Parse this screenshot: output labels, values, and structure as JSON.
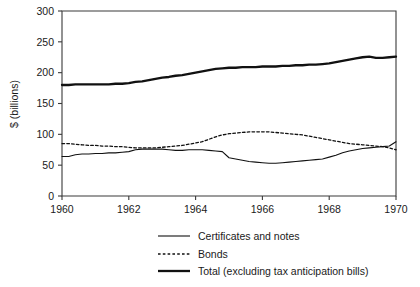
{
  "chart_data": {
    "type": "line",
    "title": "",
    "xlabel": "",
    "ylabel": "$ (billions)",
    "xlim": [
      1960,
      1970
    ],
    "ylim": [
      0,
      300
    ],
    "xticks": [
      1960,
      1962,
      1964,
      1966,
      1968,
      1970
    ],
    "xtick_labels": [
      "1960",
      "1962",
      "1964",
      "1966",
      "1968",
      "1970"
    ],
    "yticks": [
      0,
      50,
      100,
      150,
      200,
      250,
      300
    ],
    "ytick_labels": [
      "0",
      "50",
      "100",
      "150",
      "200",
      "250",
      "300"
    ],
    "grid": false,
    "legend_position": "below",
    "series": [
      {
        "name": "Certificates and notes",
        "style": "solid-thin",
        "color": "#111111",
        "x": [
          1960.0,
          1960.2,
          1960.4,
          1960.6,
          1960.8,
          1961.0,
          1961.2,
          1961.4,
          1961.6,
          1961.8,
          1962.0,
          1962.2,
          1962.4,
          1962.6,
          1962.8,
          1963.0,
          1963.2,
          1963.4,
          1963.6,
          1963.8,
          1964.0,
          1964.2,
          1964.4,
          1964.6,
          1964.8,
          1965.0,
          1965.2,
          1965.4,
          1965.6,
          1965.8,
          1966.0,
          1966.2,
          1966.4,
          1966.6,
          1966.8,
          1967.0,
          1967.2,
          1967.4,
          1967.6,
          1967.8,
          1968.0,
          1968.2,
          1968.4,
          1968.6,
          1968.8,
          1969.0,
          1969.2,
          1969.4,
          1969.6,
          1969.8,
          1970.0
        ],
        "values": [
          64,
          64,
          67,
          68,
          68,
          69,
          69,
          70,
          70,
          71,
          72,
          75,
          76,
          76,
          76,
          76,
          75,
          74,
          74,
          75,
          75,
          75,
          74,
          73,
          72,
          62,
          60,
          58,
          56,
          55,
          54,
          53,
          53,
          54,
          55,
          56,
          57,
          58,
          59,
          60,
          63,
          66,
          70,
          73,
          75,
          77,
          78,
          79,
          80,
          81,
          88
        ]
      },
      {
        "name": "Bonds",
        "style": "dashed",
        "color": "#111111",
        "x": [
          1960.0,
          1960.2,
          1960.4,
          1960.6,
          1960.8,
          1961.0,
          1961.2,
          1961.4,
          1961.6,
          1961.8,
          1962.0,
          1962.2,
          1962.4,
          1962.6,
          1962.8,
          1963.0,
          1963.2,
          1963.4,
          1963.6,
          1963.8,
          1964.0,
          1964.2,
          1964.4,
          1964.6,
          1964.8,
          1965.0,
          1965.2,
          1965.4,
          1965.6,
          1965.8,
          1966.0,
          1966.2,
          1966.4,
          1966.6,
          1966.8,
          1967.0,
          1967.2,
          1967.4,
          1967.6,
          1967.8,
          1968.0,
          1968.2,
          1968.4,
          1968.6,
          1968.8,
          1969.0,
          1969.2,
          1969.4,
          1969.6,
          1969.8,
          1970.0
        ],
        "values": [
          85,
          85,
          84,
          83,
          82,
          82,
          81,
          81,
          80,
          80,
          79,
          78,
          78,
          78,
          78,
          79,
          80,
          81,
          82,
          84,
          86,
          88,
          92,
          96,
          99,
          101,
          102,
          103,
          104,
          104,
          104,
          104,
          103,
          102,
          101,
          100,
          99,
          97,
          95,
          93,
          91,
          89,
          87,
          85,
          84,
          83,
          82,
          81,
          80,
          78,
          75
        ]
      },
      {
        "name": "Total (excluding tax anticipation bills)",
        "style": "solid-thick",
        "color": "#111111",
        "x": [
          1960.0,
          1960.2,
          1960.4,
          1960.6,
          1960.8,
          1961.0,
          1961.2,
          1961.4,
          1961.6,
          1961.8,
          1962.0,
          1962.2,
          1962.4,
          1962.6,
          1962.8,
          1963.0,
          1963.2,
          1963.4,
          1963.6,
          1963.8,
          1964.0,
          1964.2,
          1964.4,
          1964.6,
          1964.8,
          1965.0,
          1965.2,
          1965.4,
          1965.6,
          1965.8,
          1966.0,
          1966.2,
          1966.4,
          1966.6,
          1966.8,
          1967.0,
          1967.2,
          1967.4,
          1967.6,
          1967.8,
          1968.0,
          1968.2,
          1968.4,
          1968.6,
          1968.8,
          1969.0,
          1969.2,
          1969.4,
          1969.6,
          1969.8,
          1970.0
        ],
        "values": [
          180,
          180,
          181,
          181,
          181,
          181,
          181,
          181,
          182,
          182,
          183,
          185,
          186,
          188,
          190,
          192,
          193,
          195,
          196,
          198,
          200,
          202,
          204,
          206,
          207,
          208,
          208,
          209,
          209,
          209,
          210,
          210,
          210,
          211,
          211,
          212,
          212,
          213,
          213,
          214,
          215,
          217,
          219,
          221,
          223,
          225,
          226,
          224,
          224,
          225,
          226
        ]
      }
    ]
  },
  "legend": {
    "items": [
      {
        "label": "Certificates and notes",
        "style": "solid-thin"
      },
      {
        "label": "Bonds",
        "style": "dashed"
      },
      {
        "label": "Total (excluding tax anticipation bills)",
        "style": "solid-thick"
      }
    ]
  }
}
